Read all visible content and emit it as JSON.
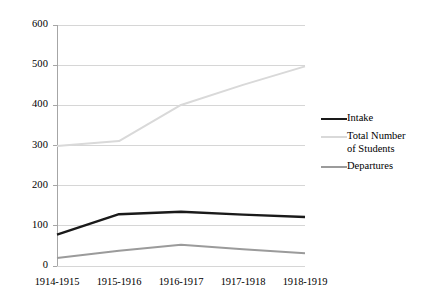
{
  "chart_data": {
    "type": "line",
    "title": "",
    "xlabel": "",
    "ylabel": "",
    "categories": [
      "1914-1915",
      "1915-1916",
      "1916-1917",
      "1917-1918",
      "1918-1919"
    ],
    "series": [
      {
        "name": "Intake",
        "color": "#1a1a1a",
        "width": 2.4,
        "values": [
          78,
          129,
          135,
          128,
          122
        ]
      },
      {
        "name": "Total Number of Students",
        "legend_label": "Total Number\nof Students",
        "color": "#d9d9d9",
        "width": 2.0,
        "values": [
          299,
          311,
          401,
          451,
          497
        ]
      },
      {
        "name": "Departures",
        "color": "#9b9b9b",
        "width": 2.0,
        "values": [
          20,
          38,
          53,
          42,
          32
        ]
      }
    ],
    "ylim": [
      0,
      600
    ],
    "yticks": [
      0,
      100,
      200,
      300,
      400,
      500,
      600
    ],
    "ytick_labels": [
      "0",
      "100",
      "200",
      "300",
      "400",
      "500",
      "600"
    ],
    "grid": true,
    "grid_color": "#d6d6d6",
    "axis_color": "#a6a6a6",
    "legend_position": "right",
    "background": "#ffffff"
  },
  "legend": {
    "entries": [
      {
        "label": "Intake"
      },
      {
        "label": "Total Number\nof Students"
      },
      {
        "label": "Departures"
      }
    ]
  }
}
